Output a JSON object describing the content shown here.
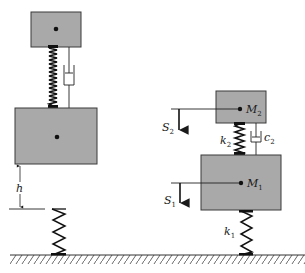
{
  "diagram": {
    "type": "mechanical spring-mass-damper schematic",
    "colors": {
      "mass_fill": "#a9a9a9",
      "mass_stroke": "#3a3a3a",
      "line": "#1a1a1a",
      "ground_hatch": "#555555"
    },
    "left_system": {
      "top_mass": {
        "label": ""
      },
      "bottom_mass": {
        "label": ""
      },
      "gap_label": "h",
      "free_spring": {
        "label": ""
      }
    },
    "right_system": {
      "mass_upper": {
        "label": "M",
        "sub": "2"
      },
      "mass_lower": {
        "label": "M",
        "sub": "1"
      },
      "spring_upper": {
        "label": "k",
        "sub": "2"
      },
      "damper_upper": {
        "label": "c",
        "sub": "2"
      },
      "spring_lower": {
        "label": "k",
        "sub": "1"
      },
      "displacement_upper": {
        "label": "S",
        "sub": "2"
      },
      "displacement_lower": {
        "label": "S",
        "sub": "1"
      }
    }
  }
}
